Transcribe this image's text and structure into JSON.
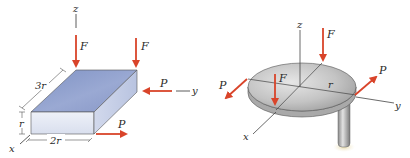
{
  "figure_left": {
    "description": "Rectangular block with loads",
    "axis_labels": {
      "x": "x",
      "y": "y",
      "z": "z"
    },
    "force_labels": {
      "F1": "F",
      "F2": "F",
      "P_side": "P",
      "P_bottom": "P"
    },
    "dimensions": {
      "length": "3r",
      "height": "r",
      "width": "2r"
    }
  },
  "figure_right": {
    "description": "Circular disk on post with loads",
    "axis_labels": {
      "x": "x",
      "y": "y",
      "z": "z"
    },
    "force_labels": {
      "F_top": "F",
      "F_inner": "F",
      "P_left": "P",
      "P_right": "P"
    },
    "dimensions": {
      "radius": "r"
    }
  },
  "colors": {
    "force_arrow": "#d9442a",
    "box_top": "#8b9ccb",
    "box_front": "#e4e9f4",
    "box_side": "#c8d1e8",
    "disk_top": "#c9c9c9",
    "disk_edge": "#9a9a9a",
    "line": "#333333"
  }
}
